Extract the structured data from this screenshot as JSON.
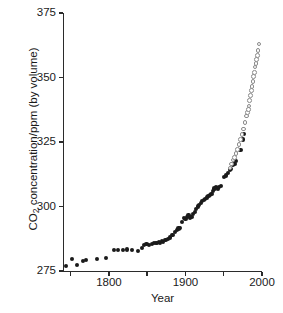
{
  "chart_data": {
    "type": "scatter",
    "title": "",
    "xlabel": "Year",
    "ylabel": "CO2 concentration/ppm (by volume)",
    "ylabel_display": "CO",
    "ylabel_sub": "2",
    "ylabel_rest": " concentration/ppm (by volume)",
    "xlim": [
      1740,
      2000
    ],
    "ylim": [
      275,
      375
    ],
    "grid": false,
    "legend": "none",
    "xticks": [
      1800,
      1900,
      2000
    ],
    "xtick_labels": [
      "1800",
      "1900",
      "2000"
    ],
    "xminor_ticks": [
      1750,
      1850,
      1950
    ],
    "yticks": [
      275,
      300,
      325,
      350,
      375
    ],
    "ytick_labels": [
      "275",
      "300",
      "325",
      "350",
      "375"
    ],
    "series": [
      {
        "name": "Ice core record",
        "marker": "filled-circle",
        "color": "#1a1a1a",
        "points": [
          [
            1744,
            277.0
          ],
          [
            1752,
            279.5
          ],
          [
            1758,
            277.2
          ],
          [
            1766,
            279.0
          ],
          [
            1770,
            279.2
          ],
          [
            1784,
            279.5
          ],
          [
            1796,
            280.0
          ],
          [
            1807,
            283.0
          ],
          [
            1812,
            283.2
          ],
          [
            1818,
            283.0
          ],
          [
            1824,
            283.3
          ],
          [
            1830,
            283.2
          ],
          [
            1838,
            282.8
          ],
          [
            1843,
            284.0
          ],
          [
            1846,
            285.0
          ],
          [
            1849,
            285.4
          ],
          [
            1852,
            285.2
          ],
          [
            1856,
            285.6
          ],
          [
            1859,
            286.0
          ],
          [
            1861,
            286.0
          ],
          [
            1863,
            285.8
          ],
          [
            1865,
            286.2
          ],
          [
            1867,
            286.0
          ],
          [
            1869,
            286.5
          ],
          [
            1871,
            286.3
          ],
          [
            1874,
            287.0
          ],
          [
            1877,
            287.5
          ],
          [
            1880,
            288.0
          ],
          [
            1883,
            289.0
          ],
          [
            1886,
            290.0
          ],
          [
            1889,
            291.0
          ],
          [
            1891,
            291.5
          ],
          [
            1893,
            291.8
          ],
          [
            1896,
            294.0
          ],
          [
            1898,
            295.5
          ],
          [
            1900,
            295.0
          ],
          [
            1902,
            296.0
          ],
          [
            1904,
            296.5
          ],
          [
            1906,
            295.5
          ],
          [
            1908,
            296.0
          ],
          [
            1910,
            297.0
          ],
          [
            1912,
            298.0
          ],
          [
            1914,
            299.0
          ],
          [
            1916,
            300.0
          ],
          [
            1918,
            300.5
          ],
          [
            1920,
            301.5
          ],
          [
            1922,
            302.0
          ],
          [
            1924,
            302.5
          ],
          [
            1926,
            303.0
          ],
          [
            1928,
            303.5
          ],
          [
            1930,
            304.0
          ],
          [
            1932,
            304.5
          ],
          [
            1934,
            305.0
          ],
          [
            1936,
            306.0
          ],
          [
            1938,
            307.0
          ],
          [
            1940,
            307.5
          ],
          [
            1942,
            307.0
          ],
          [
            1944,
            307.5
          ],
          [
            1946,
            308.0
          ],
          [
            1950,
            311.5
          ],
          [
            1953,
            312.0
          ],
          [
            1956,
            313.0
          ],
          [
            1958,
            314.0
          ],
          [
            1960,
            314.5
          ],
          [
            1962,
            316.0
          ],
          [
            1964,
            316.5
          ],
          [
            1966,
            317.5
          ],
          [
            1972,
            322.0
          ],
          [
            1975,
            326.0
          ],
          [
            1977,
            328.0
          ]
        ]
      },
      {
        "name": "Mauna Loa record",
        "marker": "open-circle",
        "color": "#8a8a8a",
        "points": [
          [
            1958,
            315.0
          ],
          [
            1960,
            316.5
          ],
          [
            1962,
            318.0
          ],
          [
            1964,
            319.0
          ],
          [
            1966,
            320.5
          ],
          [
            1968,
            322.0
          ],
          [
            1970,
            324.0
          ],
          [
            1972,
            326.0
          ],
          [
            1974,
            328.0
          ],
          [
            1976,
            330.0
          ],
          [
            1978,
            332.5
          ],
          [
            1980,
            335.0
          ],
          [
            1981,
            336.5
          ],
          [
            1982,
            337.5
          ],
          [
            1983,
            339.0
          ],
          [
            1984,
            341.0
          ],
          [
            1985,
            343.0
          ],
          [
            1986,
            345.0
          ],
          [
            1987,
            346.5
          ],
          [
            1988,
            348.5
          ],
          [
            1989,
            350.5
          ],
          [
            1990,
            352.0
          ],
          [
            1991,
            354.0
          ],
          [
            1992,
            355.5
          ],
          [
            1993,
            357.0
          ],
          [
            1994,
            358.5
          ],
          [
            1995,
            360.5
          ],
          [
            1996,
            363.0
          ]
        ]
      }
    ]
  },
  "axes": {
    "plot_left_px": 63,
    "plot_right_px": 262,
    "plot_top_px": 13,
    "plot_bottom_px": 271
  }
}
